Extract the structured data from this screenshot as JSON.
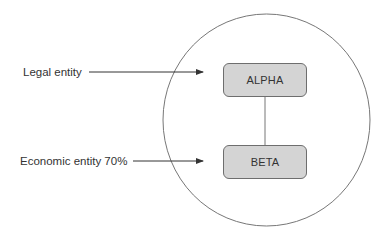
{
  "diagram": {
    "labels": {
      "legal": "Legal entity",
      "economic": "Economic entity 70%"
    },
    "nodes": [
      {
        "id": "alpha",
        "label": "ALPHA"
      },
      {
        "id": "beta",
        "label": "BETA"
      }
    ],
    "edges": [
      {
        "from": "alpha",
        "to": "beta",
        "type": "line"
      }
    ],
    "colors": {
      "box_fill": "#d4d4d4",
      "box_border": "#6e6e6e",
      "circle_stroke": "#777777",
      "arrow": "#333333",
      "text": "#333333"
    }
  }
}
